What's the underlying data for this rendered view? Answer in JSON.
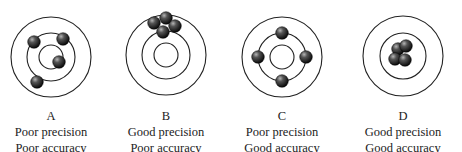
{
  "colors": {
    "ring": "#222222",
    "ball_dark": "#111111",
    "ball_light": "#9a9a9a",
    "text": "#222222"
  },
  "targets": [
    {
      "id": "A",
      "letter": "A",
      "precision": "Poor precision",
      "accuracy": "Poor accuracy",
      "center": [
        51,
        57
      ],
      "rings": [
        40,
        24,
        12
      ],
      "balls": [
        [
          34,
          42
        ],
        [
          63,
          39
        ],
        [
          59,
          62
        ],
        [
          37,
          82
        ]
      ]
    },
    {
      "id": "B",
      "letter": "B",
      "precision": "Good precision",
      "accuracy": "Poor accuracy",
      "center": [
        166,
        55
      ],
      "rings": [
        40,
        24,
        12
      ],
      "balls": [
        [
          154,
          23
        ],
        [
          166,
          18
        ],
        [
          175,
          26
        ],
        [
          163,
          32
        ]
      ]
    },
    {
      "id": "C",
      "letter": "C",
      "precision": "Poor precision",
      "accuracy": "Good accuracy",
      "center": [
        282,
        57
      ],
      "rings": [
        40,
        24,
        12
      ],
      "balls": [
        [
          282,
          33
        ],
        [
          258,
          57
        ],
        [
          306,
          57
        ],
        [
          282,
          81
        ]
      ]
    },
    {
      "id": "D",
      "letter": "D",
      "precision": "Good precision",
      "accuracy": "Good accuracy",
      "center": [
        403,
        56
      ],
      "rings": [
        40,
        23
      ],
      "balls": [
        [
          398,
          49
        ],
        [
          406,
          46
        ],
        [
          395,
          59
        ],
        [
          405,
          60
        ]
      ]
    }
  ]
}
